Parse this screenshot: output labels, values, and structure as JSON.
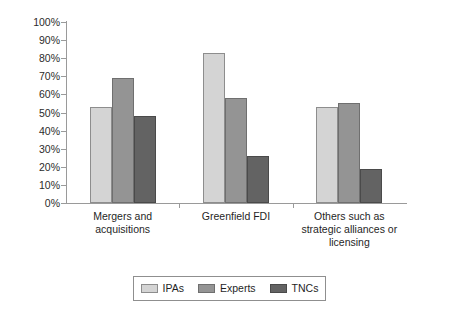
{
  "chart_data": {
    "type": "bar",
    "title": "",
    "subtitle": "",
    "xlabel": "",
    "ylabel": "",
    "ylim": [
      0,
      100
    ],
    "grid": false,
    "legend_position": "bottom",
    "categories": [
      "Mergers and acquisitions",
      "Greenfield FDI",
      "Others such as strategic alliances or licensing"
    ],
    "category_lines": [
      [
        "Mergers and",
        "acquisitions"
      ],
      [
        "Greenfield FDI"
      ],
      [
        "Others such as",
        "strategic alliances or",
        "licensing"
      ]
    ],
    "series": [
      {
        "name": "IPAs",
        "color": "#d4d4d4",
        "values": [
          53,
          83,
          53
        ]
      },
      {
        "name": "Experts",
        "color": "#949494",
        "values": [
          69,
          58,
          55
        ]
      },
      {
        "name": "TNCs",
        "color": "#636363",
        "values": [
          48,
          26,
          19
        ]
      }
    ],
    "y_ticks": [
      0,
      10,
      20,
      30,
      40,
      50,
      60,
      70,
      80,
      90,
      100
    ],
    "y_tick_labels": [
      "0%",
      "10%",
      "20%",
      "30%",
      "40%",
      "50%",
      "60%",
      "70%",
      "80%",
      "90%",
      "100%"
    ]
  },
  "legend": {
    "items": [
      {
        "label": "IPAs"
      },
      {
        "label": "Experts"
      },
      {
        "label": "TNCs"
      }
    ]
  }
}
